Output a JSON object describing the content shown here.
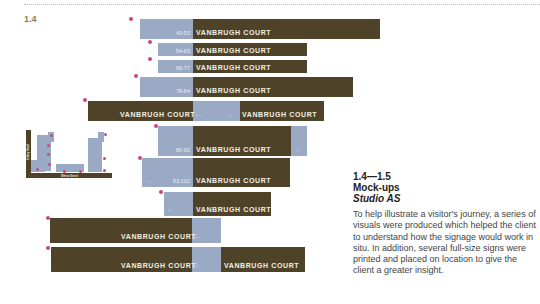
{
  "page": {
    "figure_number": "1.4"
  },
  "signs": {
    "label": "VANBRUGH COURT",
    "rows": [
      {
        "range": "43-53"
      },
      {
        "range": "54-65"
      },
      {
        "range": "66-77"
      },
      {
        "range": "78-84"
      },
      {
        "range": ""
      },
      {
        "range": "85-92"
      },
      {
        "range": "93-102"
      },
      {
        "range": ""
      },
      {
        "range": ""
      },
      {
        "range": ""
      }
    ]
  },
  "plan": {
    "road_vertical": "Sibley Road",
    "road_horizontal": "Wheat Street"
  },
  "caption": {
    "range": "1.4—1.5",
    "title": "Mock-ups",
    "studio": "Studio AS",
    "body": "To help illustrate a visitor's journey, a series of visuals were produced which helped the client to understand how the signage would work in situ. In addition, several full-size signs were printed and placed on location to give the client a greater insight."
  },
  "colors": {
    "brown": "#4e4228",
    "blue": "#9aa9c4",
    "pin": "#c34b7a",
    "accent_text": "#8a7f52"
  }
}
